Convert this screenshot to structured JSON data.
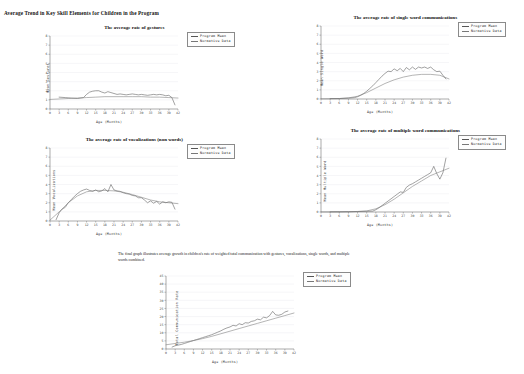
{
  "page": {
    "title": "Average Trend in Key Skill Elements for Children in the Program",
    "caption": "The final graph illustrates average growth in children's rate of weighted total communication with gestures, vocalizations, single words, and multiple words combined."
  },
  "legend": {
    "program_label": "Program Mean",
    "normative_label": "Normative Data",
    "program_color": "#555555",
    "normative_color": "#777777"
  },
  "axis": {
    "xlabel": "Age (Months)",
    "xticks": [
      0,
      3,
      6,
      9,
      12,
      15,
      18,
      21,
      24,
      27,
      30,
      33,
      36,
      39,
      42
    ],
    "yticks_small": [
      0,
      1,
      2,
      3,
      4,
      5,
      6,
      7,
      8
    ],
    "yticks_total": [
      0,
      5,
      10,
      15,
      20,
      25,
      30,
      35,
      40,
      45
    ]
  },
  "chart_data": [
    {
      "id": "gestures",
      "type": "line",
      "title": "The average rate of gestures",
      "xlabel": "Age (Months)",
      "ylabel": "Mean Gestures",
      "xlim": [
        0,
        42
      ],
      "ylim": [
        0,
        8
      ],
      "grid": true,
      "legend_position": "right",
      "x": [
        0,
        3,
        6,
        9,
        12,
        15,
        18,
        21,
        24,
        27,
        30,
        33,
        36,
        39,
        42
      ],
      "series": [
        {
          "name": "Program Mean",
          "x": [
            3,
            5,
            7,
            9,
            11,
            12,
            13,
            14,
            15,
            16,
            17,
            18,
            19,
            20,
            21,
            22,
            23,
            24,
            25,
            26,
            27,
            28,
            29,
            30,
            31,
            32,
            33,
            34,
            35,
            36,
            37,
            38,
            39,
            40,
            41
          ],
          "values": [
            1.3,
            1.25,
            1.2,
            1.15,
            1.25,
            1.6,
            1.85,
            1.95,
            2.0,
            2.0,
            1.85,
            1.75,
            1.9,
            1.8,
            1.7,
            1.6,
            1.65,
            1.6,
            1.55,
            1.6,
            1.65,
            1.6,
            1.55,
            1.6,
            1.55,
            1.5,
            1.55,
            1.6,
            1.55,
            1.6,
            1.55,
            1.45,
            1.5,
            1.25,
            0.45
          ]
        },
        {
          "name": "Normative Data",
          "x": [
            0,
            3,
            6,
            9,
            12,
            15,
            18,
            21,
            24,
            27,
            30,
            33,
            36,
            39,
            42
          ],
          "values": [
            1.05,
            1.1,
            1.15,
            1.2,
            1.25,
            1.3,
            1.35,
            1.35,
            1.35,
            1.35,
            1.35,
            1.3,
            1.3,
            1.25,
            1.2
          ]
        }
      ]
    },
    {
      "id": "single-word",
      "type": "line",
      "title": "The average rate of single word communications",
      "xlabel": "Age (Months)",
      "ylabel": "Mean Single Word",
      "xlim": [
        0,
        42
      ],
      "ylim": [
        0,
        8
      ],
      "grid": true,
      "legend_position": "right",
      "series": [
        {
          "name": "Program Mean",
          "x": [
            3,
            6,
            9,
            11,
            12,
            13,
            14,
            15,
            16,
            17,
            18,
            19,
            20,
            21,
            22,
            23,
            24,
            25,
            26,
            27,
            28,
            29,
            30,
            31,
            32,
            33,
            34,
            35,
            36,
            37,
            38,
            39,
            40,
            41
          ],
          "values": [
            0.05,
            0.05,
            0.1,
            0.15,
            0.25,
            0.4,
            0.6,
            0.85,
            1.15,
            1.45,
            1.8,
            2.15,
            2.5,
            2.8,
            3.05,
            3.0,
            3.3,
            3.1,
            3.35,
            3.0,
            3.45,
            3.2,
            3.5,
            3.25,
            3.5,
            3.4,
            3.5,
            3.35,
            3.5,
            3.2,
            3.0,
            3.05,
            2.6,
            2.2
          ]
        },
        {
          "name": "Normative Data",
          "x": [
            0,
            3,
            6,
            9,
            12,
            15,
            18,
            21,
            24,
            27,
            30,
            33,
            36,
            39,
            42
          ],
          "values": [
            0.02,
            0.03,
            0.05,
            0.12,
            0.3,
            0.7,
            1.2,
            1.7,
            2.1,
            2.4,
            2.6,
            2.7,
            2.7,
            2.6,
            2.2
          ]
        }
      ]
    },
    {
      "id": "vocalizations",
      "type": "line",
      "title": "The average rate of vocalizations (non words)",
      "xlabel": "Age (Months)",
      "ylabel": "Mean Vocalizations",
      "xlim": [
        0,
        42
      ],
      "ylim": [
        0,
        8
      ],
      "grid": true,
      "legend_position": "right",
      "series": [
        {
          "name": "Program Mean",
          "x": [
            2,
            3,
            4,
            5,
            6,
            7,
            8,
            9,
            10,
            11,
            12,
            13,
            14,
            15,
            16,
            17,
            18,
            19,
            20,
            21,
            22,
            23,
            24,
            25,
            26,
            27,
            28,
            29,
            30,
            31,
            32,
            33,
            34,
            35,
            36,
            37,
            38,
            39,
            40,
            41
          ],
          "values": [
            0.15,
            0.9,
            1.3,
            1.5,
            2.0,
            2.35,
            2.7,
            3.0,
            3.25,
            3.4,
            3.5,
            3.35,
            3.25,
            3.4,
            3.2,
            3.3,
            3.55,
            3.2,
            4.0,
            3.4,
            3.3,
            3.25,
            3.1,
            3.0,
            2.95,
            2.8,
            2.75,
            2.55,
            2.55,
            2.3,
            2.0,
            2.2,
            1.95,
            2.15,
            1.85,
            2.1,
            2.0,
            2.1,
            2.05,
            1.3
          ]
        },
        {
          "name": "Normative Data",
          "x": [
            0,
            3,
            6,
            9,
            12,
            15,
            18,
            21,
            24,
            27,
            30,
            33,
            36,
            39,
            42
          ],
          "values": [
            0.1,
            1.0,
            2.0,
            2.75,
            3.2,
            3.35,
            3.35,
            3.3,
            3.15,
            2.9,
            2.6,
            2.3,
            2.1,
            2.0,
            1.9
          ]
        }
      ]
    },
    {
      "id": "multiple-word",
      "type": "line",
      "title": "The average rate of multiple word communications",
      "xlabel": "Age (Months)",
      "ylabel": "Mean Multiple Word",
      "xlim": [
        0,
        42
      ],
      "ylim": [
        0,
        8
      ],
      "grid": true,
      "legend_position": "right",
      "series": [
        {
          "name": "Program Mean",
          "x": [
            3,
            6,
            9,
            12,
            15,
            17,
            18,
            19,
            20,
            21,
            22,
            23,
            24,
            25,
            26,
            27,
            28,
            29,
            30,
            31,
            32,
            33,
            34,
            35,
            36,
            37,
            38,
            39,
            40,
            41
          ],
          "values": [
            0.02,
            0.02,
            0.03,
            0.05,
            0.08,
            0.1,
            0.25,
            0.45,
            0.7,
            0.95,
            1.2,
            1.45,
            1.7,
            1.95,
            2.2,
            2.15,
            2.7,
            2.95,
            3.1,
            3.3,
            3.5,
            3.7,
            3.9,
            4.1,
            4.3,
            5.0,
            4.2,
            3.6,
            4.3,
            5.9
          ]
        },
        {
          "name": "Normative Data",
          "x": [
            0,
            3,
            6,
            9,
            12,
            15,
            18,
            21,
            24,
            27,
            30,
            33,
            36,
            39,
            42
          ],
          "values": [
            0.01,
            0.01,
            0.02,
            0.03,
            0.06,
            0.12,
            0.35,
            0.8,
            1.4,
            2.1,
            2.8,
            3.4,
            4.0,
            4.4,
            4.8
          ]
        }
      ]
    },
    {
      "id": "total-communication",
      "type": "line",
      "title": "",
      "xlabel": "Age (Months)",
      "ylabel": "Total Communication Rate",
      "xlim": [
        0,
        42
      ],
      "ylim": [
        0,
        45
      ],
      "grid": true,
      "legend_position": "right",
      "series": [
        {
          "name": "Program Mean",
          "x": [
            2,
            3,
            4,
            5,
            6,
            7,
            8,
            9,
            10,
            11,
            12,
            13,
            14,
            15,
            16,
            17,
            18,
            19,
            20,
            21,
            22,
            23,
            24,
            25,
            26,
            27,
            28,
            29,
            30,
            31,
            32,
            33,
            34,
            35,
            36,
            37,
            38,
            39,
            40
          ],
          "values": [
            1.2,
            2.0,
            2.4,
            2.8,
            3.4,
            4.0,
            4.6,
            5.2,
            5.8,
            6.4,
            7.0,
            7.6,
            8.2,
            8.8,
            9.6,
            10.4,
            11.2,
            12.2,
            13.0,
            13.6,
            14.6,
            14.2,
            15.6,
            15.0,
            16.2,
            16.0,
            17.0,
            17.4,
            18.4,
            18.0,
            19.6,
            19.2,
            20.6,
            23.2,
            21.0,
            20.8,
            21.4,
            22.8,
            23.4
          ]
        },
        {
          "name": "Normative Data",
          "x": [
            0,
            3,
            6,
            9,
            12,
            15,
            18,
            21,
            24,
            27,
            30,
            33,
            36,
            39,
            42
          ],
          "values": [
            2.6,
            3.4,
            4.2,
            5.2,
            6.4,
            7.8,
            9.4,
            11.0,
            12.6,
            14.2,
            15.8,
            17.4,
            19.0,
            20.6,
            22.2
          ]
        }
      ]
    }
  ]
}
